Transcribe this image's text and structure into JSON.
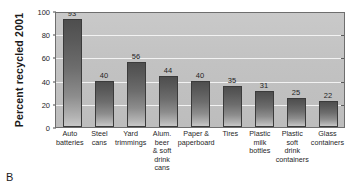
{
  "figure": {
    "panel_letter": "B"
  },
  "chart_data": {
    "type": "bar",
    "title": "",
    "xlabel": "",
    "ylabel": "Percent recycled 2001",
    "ylim": [
      0,
      100
    ],
    "yticks": [
      0,
      20,
      40,
      60,
      80,
      100
    ],
    "ytick_labels": [
      "0",
      "20",
      "40",
      "60",
      "80",
      "100"
    ],
    "grid": true,
    "legend": "none",
    "categories": [
      "Auto batteries",
      "Steel cans",
      "Yard trimmings",
      "Alum. beer & soft drink cans",
      "Paper & paperboard",
      "Tires",
      "Plastic milk bottles",
      "Plastic soft drink containers",
      "Glass containers"
    ],
    "values": [
      93,
      40,
      56,
      44,
      40,
      35,
      31,
      25,
      22
    ],
    "data_labels": [
      "93",
      "40",
      "56",
      "44",
      "40",
      "35",
      "31",
      "25",
      "22"
    ],
    "bars": [
      {
        "label": "Auto batteries",
        "label_lines": [
          "Auto",
          "batteries"
        ],
        "value": 93,
        "value_label": "93"
      },
      {
        "label": "Steel cans",
        "label_lines": [
          "Steel",
          "cans"
        ],
        "value": 40,
        "value_label": "40"
      },
      {
        "label": "Yard trimmings",
        "label_lines": [
          "Yard",
          "trimmings"
        ],
        "value": 56,
        "value_label": "56"
      },
      {
        "label": "Alum. beer & soft drink cans",
        "label_lines": [
          "Alum.",
          "beer",
          "& soft",
          "drink",
          "cans"
        ],
        "value": 44,
        "value_label": "44"
      },
      {
        "label": "Paper & paperboard",
        "label_lines": [
          "Paper &",
          "paperboard"
        ],
        "value": 40,
        "value_label": "40"
      },
      {
        "label": "Tires",
        "label_lines": [
          "Tires"
        ],
        "value": 35,
        "value_label": "35"
      },
      {
        "label": "Plastic milk bottles",
        "label_lines": [
          "Plastic",
          "milk",
          "bottles"
        ],
        "value": 31,
        "value_label": "31"
      },
      {
        "label": "Plastic soft drink containers",
        "label_lines": [
          "Plastic",
          "soft",
          "drink",
          "containers"
        ],
        "value": 25,
        "value_label": "25"
      },
      {
        "label": "Glass containers",
        "label_lines": [
          "Glass",
          "containers"
        ],
        "value": 22,
        "value_label": "22"
      }
    ],
    "colors": {
      "plot_background": "#c4c4c4",
      "bar_top": "#4e4e4e",
      "bar_bottom": "#c8c8c8",
      "bar_outline": "#3b3b3b",
      "gridline": "#f2f2f2",
      "axis": "#6e6e6e",
      "text": "#1f1f1f",
      "page_background": "#ffffff"
    }
  }
}
